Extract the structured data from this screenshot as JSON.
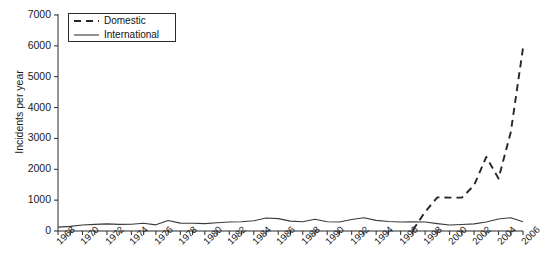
{
  "chart_data": {
    "type": "line",
    "title": "",
    "xlabel": "",
    "ylabel": "Incidents per year",
    "xlim": [
      1968,
      2006
    ],
    "ylim": [
      0,
      7000
    ],
    "grid": false,
    "legend_position": "top-left",
    "y_ticks": [
      0,
      1000,
      2000,
      3000,
      4000,
      5000,
      6000,
      7000
    ],
    "y_tick_labels": [
      "0",
      "1000",
      "2000",
      "3000",
      "4000",
      "5000",
      "6000",
      "7000"
    ],
    "x_ticks": [
      1968,
      1970,
      1972,
      1974,
      1976,
      1978,
      1980,
      1982,
      1984,
      1986,
      1988,
      1990,
      1992,
      1994,
      1996,
      1998,
      2000,
      2002,
      2004,
      2006
    ],
    "x_tick_labels": [
      "1968",
      "1970",
      "1972",
      "1974",
      "1976",
      "1978",
      "1980",
      "1982",
      "1984",
      "1986",
      "1988",
      "1990",
      "1992",
      "1994",
      "1996",
      "1998",
      "2000",
      "2002",
      "2004",
      "2006"
    ],
    "x": [
      1968,
      1969,
      1970,
      1971,
      1972,
      1973,
      1974,
      1975,
      1976,
      1977,
      1978,
      1979,
      1980,
      1981,
      1982,
      1983,
      1984,
      1985,
      1986,
      1987,
      1988,
      1989,
      1990,
      1991,
      1992,
      1993,
      1994,
      1995,
      1996,
      1997,
      1998,
      1999,
      2000,
      2001,
      2002,
      2003,
      2004,
      2005,
      2006
    ],
    "series": [
      {
        "name": "Domestic",
        "style": "dashed",
        "color": "#262626",
        "values": [
          null,
          null,
          null,
          null,
          null,
          null,
          null,
          null,
          null,
          null,
          null,
          null,
          null,
          null,
          null,
          null,
          null,
          null,
          null,
          null,
          null,
          null,
          null,
          null,
          null,
          null,
          null,
          null,
          null,
          30,
          620,
          1090,
          1080,
          1080,
          1480,
          2400,
          1700,
          3200,
          5930
        ]
      },
      {
        "name": "International",
        "style": "solid",
        "color": "#3a3a3a",
        "values": [
          125,
          150,
          195,
          215,
          230,
          215,
          220,
          250,
          200,
          340,
          255,
          250,
          240,
          265,
          290,
          300,
          330,
          420,
          400,
          320,
          300,
          380,
          300,
          290,
          370,
          430,
          345,
          310,
          290,
          300,
          290,
          240,
          195,
          210,
          230,
          290,
          390,
          430,
          300
        ]
      }
    ]
  },
  "legend": {
    "items": [
      {
        "label": "Domestic",
        "style": "dashed",
        "swatch": "legend-dash-swatch"
      },
      {
        "label": "International",
        "style": "solid",
        "swatch": "legend-solid-swatch"
      }
    ]
  },
  "axes": {
    "y_axis_title": "Incidents per year"
  },
  "colors": {
    "background": "#ffffff",
    "axis": "#2b2b2b",
    "domestic": "#262626",
    "international": "#3a3a3a"
  }
}
